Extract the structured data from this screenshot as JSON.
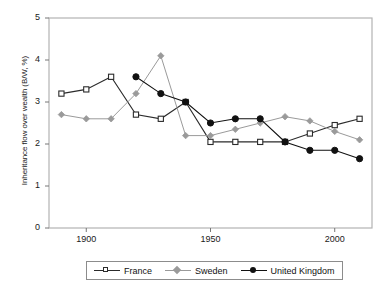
{
  "chart_data": {
    "type": "line",
    "title": "",
    "xlabel": "",
    "ylabel": "Inheritance flow over wealth (B/W, %)",
    "xlim": [
      1885,
      2015
    ],
    "ylim": [
      0,
      5
    ],
    "yticks": [
      "0",
      "1",
      "2",
      "3",
      "4",
      "5"
    ],
    "xticks": [
      "1900",
      "1950",
      "2000"
    ],
    "grid": false,
    "legend_position": "below-center",
    "series": [
      {
        "name": "France",
        "color": "#2b2b2b",
        "marker": "open-square",
        "x": [
          1890,
          1900,
          1910,
          1920,
          1930,
          1940,
          1950,
          1960,
          1970,
          1980,
          1990,
          2000,
          2010
        ],
        "values": [
          3.2,
          3.3,
          3.6,
          2.7,
          2.6,
          3.0,
          2.05,
          2.05,
          2.05,
          2.05,
          2.25,
          2.45,
          2.6
        ]
      },
      {
        "name": "Sweden",
        "color": "#9a9a9a",
        "marker": "diamond",
        "x": [
          1890,
          1900,
          1910,
          1920,
          1930,
          1940,
          1950,
          1960,
          1970,
          1980,
          1990,
          2000,
          2010
        ],
        "values": [
          2.7,
          2.6,
          2.6,
          3.2,
          4.1,
          2.2,
          2.2,
          2.35,
          2.5,
          2.65,
          2.55,
          2.3,
          2.1
        ]
      },
      {
        "name": "United Kingdom",
        "color": "#111111",
        "marker": "filled-circle",
        "x": [
          1920,
          1930,
          1940,
          1950,
          1960,
          1970,
          1980,
          1990,
          2000,
          2010
        ],
        "values": [
          3.6,
          3.2,
          3.0,
          2.5,
          2.6,
          2.6,
          2.05,
          1.85,
          1.85,
          1.65
        ]
      }
    ]
  },
  "legend": {
    "items": [
      {
        "label": "France"
      },
      {
        "label": "Sweden"
      },
      {
        "label": "United Kingdom"
      }
    ]
  }
}
